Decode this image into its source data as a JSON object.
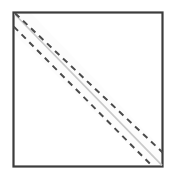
{
  "canvas": {
    "width": 175,
    "height": 179,
    "background": "#ffffff"
  },
  "figure": {
    "kind": "geometry-fold-diagram",
    "title": "",
    "caption": "",
    "labels": []
  },
  "square": {
    "name": "paper-square",
    "x": 13.5,
    "y": 12.5,
    "width": 149,
    "height": 154,
    "stroke": "#3c3c3c",
    "stroke_width": 2.2,
    "fill": "#ffffff"
  },
  "band": {
    "name": "diagonal-fold-band",
    "fill": "#fcfcfc",
    "points": "13.5,12.5 13.5,33.0 150.5,166.5 163.0,166.5 163.0,150.0 30.0,12.5",
    "offset_px": 10
  },
  "solid_diagonal": {
    "name": "fold-crease-line",
    "x1": 14.5,
    "y1": 14.0,
    "x2": 162.0,
    "y2": 165.5,
    "stroke": "#c9c9c9",
    "stroke_width": 1.6,
    "style": "solid"
  },
  "dashed_upper": {
    "name": "fold-guide-line-upper",
    "x1": 15.0,
    "y1": 13.0,
    "x2": 163.0,
    "y2": 152.0,
    "stroke": "#4a4a4a",
    "stroke_width": 2.0,
    "style": "dashed",
    "dash_array": "6 5"
  },
  "dashed_lower": {
    "name": "fold-guide-line-lower",
    "x1": 13.5,
    "y1": 27.0,
    "x2": 152.0,
    "y2": 166.5,
    "stroke": "#4a4a4a",
    "stroke_width": 2.0,
    "style": "dashed",
    "dash_array": "6 5"
  },
  "colors": {
    "outline": "#3c3c3c",
    "dash": "#4a4a4a",
    "crease": "#c9c9c9",
    "paper": "#ffffff",
    "band_fill": "#fcfcfc"
  }
}
